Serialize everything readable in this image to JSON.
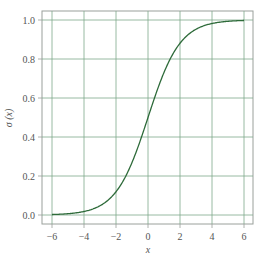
{
  "chart_data": {
    "type": "line",
    "title": "",
    "xlabel": "x",
    "ylabel": "σ (x)",
    "xlim": [
      -6.6,
      6.6
    ],
    "ylim": [
      -0.05,
      1.05
    ],
    "grid": true,
    "legend": null,
    "x_ticks": [
      -6,
      -4,
      -2,
      0,
      2,
      4,
      6
    ],
    "x_tick_labels": [
      "−6",
      "−4",
      "−2",
      "0",
      "2",
      "4",
      "6"
    ],
    "y_ticks": [
      0.0,
      0.2,
      0.4,
      0.6,
      0.8,
      1.0
    ],
    "y_tick_labels": [
      "0.0",
      "0.2",
      "0.4",
      "0.6",
      "0.8",
      "1.0"
    ],
    "series": [
      {
        "name": "sigmoid",
        "function": "1/(1+exp(-x))",
        "x": [
          -6,
          -5,
          -4,
          -3,
          -2,
          -1,
          0,
          1,
          2,
          3,
          4,
          5,
          6
        ],
        "values": [
          0.0025,
          0.0067,
          0.018,
          0.047,
          0.119,
          0.269,
          0.5,
          0.731,
          0.881,
          0.953,
          0.982,
          0.993,
          0.9975
        ]
      }
    ]
  },
  "colors": {
    "curve": "#2e6b3a",
    "grid": "#7fa88a",
    "frame": "#9aa09b",
    "text": "#555555"
  }
}
